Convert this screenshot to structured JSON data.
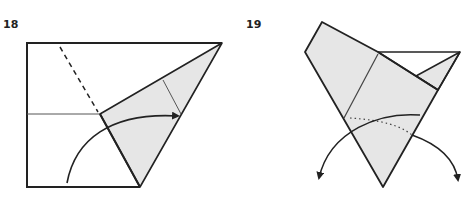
{
  "colors": {
    "paper_fill": "#e6e6e6",
    "line": "#222222",
    "crease": "#555555",
    "background": "#ffffff"
  },
  "steps": [
    {
      "number": "18",
      "description": "Valley fold along dashed line, bringing shaded flap to the right",
      "elements": [
        "square outline",
        "shaded flap",
        "valley fold dashed line",
        "horizontal crease",
        "curved fold arrow"
      ]
    },
    {
      "number": "19",
      "description": "Swivel both sides down along dotted creases",
      "elements": [
        "folded shape",
        "dotted crease",
        "two curved arrows pointing down"
      ]
    }
  ]
}
